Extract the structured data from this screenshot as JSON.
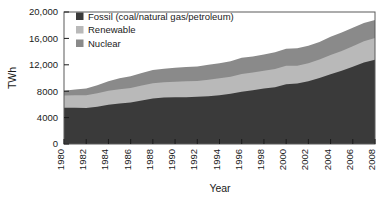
{
  "chart_data": {
    "type": "area",
    "title": "",
    "subtitle": "",
    "xlabel": "Year",
    "ylabel": "TWh",
    "xlim": [
      1980,
      2008
    ],
    "ylim": [
      0,
      20000
    ],
    "grid": false,
    "stacked": true,
    "legend_position": "top-left",
    "xticks": [
      "1980",
      "1982",
      "1984",
      "1986",
      "1988",
      "1990",
      "1992",
      "1994",
      "1996",
      "1998",
      "2000",
      "2002",
      "2004",
      "2006",
      "2008"
    ],
    "yticks": [
      "0",
      "4000",
      "8000",
      "12,000",
      "16,000",
      "20,000"
    ],
    "ytick_values": [
      0,
      4000,
      8000,
      12000,
      16000,
      20000
    ],
    "x": [
      1980,
      1981,
      1982,
      1983,
      1984,
      1985,
      1986,
      1987,
      1988,
      1989,
      1990,
      1991,
      1992,
      1993,
      1994,
      1995,
      1996,
      1997,
      1998,
      1999,
      2000,
      2001,
      2002,
      2003,
      2004,
      2005,
      2006,
      2007,
      2008
    ],
    "series": [
      {
        "name": "Fossil (coal/natural gas/petroleum)",
        "color": "#3a3a3a",
        "legend_swatch": "#3a3a3a",
        "values": [
          5500,
          5500,
          5450,
          5650,
          5950,
          6150,
          6300,
          6600,
          6900,
          7050,
          7100,
          7100,
          7150,
          7250,
          7400,
          7600,
          7900,
          8150,
          8400,
          8600,
          9050,
          9150,
          9500,
          10000,
          10550,
          11100,
          11700,
          12350,
          12750
        ]
      },
      {
        "name": "Renewable",
        "color": "#b9b9b9",
        "legend_swatch": "#b9b9b9",
        "values": [
          1850,
          1900,
          1950,
          2050,
          2100,
          2150,
          2200,
          2250,
          2300,
          2300,
          2350,
          2400,
          2400,
          2500,
          2550,
          2600,
          2700,
          2700,
          2700,
          2750,
          2800,
          2700,
          2750,
          2800,
          2950,
          3000,
          3100,
          3200,
          3300
        ]
      },
      {
        "name": "Nuclear",
        "color": "#8a8a8a",
        "legend_swatch": "#8a8a8a",
        "values": [
          700,
          850,
          1000,
          1200,
          1450,
          1650,
          1750,
          1900,
          2000,
          2050,
          2100,
          2150,
          2200,
          2250,
          2300,
          2350,
          2450,
          2400,
          2450,
          2550,
          2600,
          2650,
          2650,
          2650,
          2750,
          2800,
          2800,
          2800,
          2750
        ]
      }
    ],
    "totals_note": ""
  },
  "legend": {
    "items": [
      {
        "label": "Fossil (coal/natural gas/petroleum)"
      },
      {
        "label": "Renewable"
      },
      {
        "label": "Nuclear"
      }
    ]
  },
  "colors": {
    "fossil": "#3a3a3a",
    "renewable": "#b9b9b9",
    "nuclear": "#8a8a8a",
    "frame": "#5a5a5a",
    "text": "#1a1a1a",
    "background": "#ffffff"
  }
}
